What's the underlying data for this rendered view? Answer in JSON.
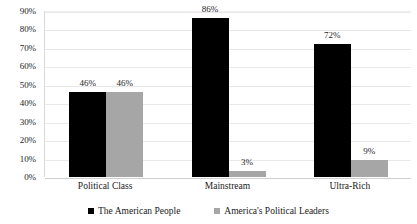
{
  "chart_data": {
    "type": "bar",
    "title": "",
    "subtitle": "",
    "xlabel": "",
    "ylabel": "",
    "categories": [
      "Political Class",
      "Mainstream",
      "Ultra-Rich"
    ],
    "series": [
      {
        "name": "The American People",
        "color": "#000000",
        "values": [
          46,
          86,
          72
        ],
        "labels": [
          "46%",
          "86%",
          "72%"
        ]
      },
      {
        "name": "America's Political Leaders",
        "color": "#A6A6A6",
        "values": [
          46,
          3,
          9
        ],
        "labels": [
          "46%",
          "3%",
          "9%"
        ]
      }
    ],
    "ylim": [
      0,
      90
    ],
    "ytick_values": [
      0,
      10,
      20,
      30,
      40,
      50,
      60,
      70,
      80,
      90
    ],
    "ytick_labels": [
      "0%",
      "10%",
      "20%",
      "30%",
      "40%",
      "50%",
      "60%",
      "70%",
      "80%",
      "90%"
    ],
    "grid": true,
    "grid_axis": "y",
    "legend_position": "bottom",
    "value_suffix": "%",
    "background_color": "#FFFFFF",
    "gridline_color": "#E8E8E8",
    "axis_color": "#D9D9D9"
  }
}
